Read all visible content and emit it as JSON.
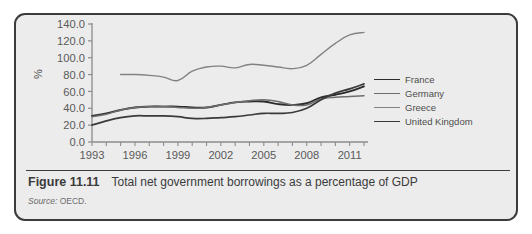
{
  "figure": {
    "number_label": "Figure 11.11",
    "caption": "Total net government borrowings as a percentage of GDP",
    "source_label": "Source:",
    "source_value": "OECD."
  },
  "colors": {
    "card_background": "#ececec",
    "card_border": "#3b3b3b",
    "axis": "#8c8c8c",
    "france": "#2b2b2b",
    "germany": "#6e6e6e",
    "greece": "#828282",
    "united_kingdom": "#3a3a3a",
    "tick_text": "#5a5a5a",
    "caption_text": "#3b3b3b"
  },
  "legend": {
    "position": "right",
    "entries": [
      {
        "label": "France",
        "color": "#2b2b2b"
      },
      {
        "label": "Germany",
        "color": "#6e6e6e"
      },
      {
        "label": "Greece",
        "color": "#828282"
      },
      {
        "label": "United Kingdom",
        "color": "#3a3a3a"
      }
    ]
  },
  "axes": {
    "y_unit_label": "%",
    "y_ticks": [
      "0.0",
      "20.0",
      "40.0",
      "60.0",
      "80.0",
      "100.0",
      "120.0",
      "140.0"
    ],
    "x_ticks": [
      "1993",
      "1996",
      "1999",
      "2002",
      "2005",
      "2008",
      "2011"
    ]
  },
  "chart_data": {
    "type": "line",
    "title": "Total net government borrowings as a percentage of GDP",
    "xlabel": "",
    "ylabel": "%",
    "ylim": [
      0,
      140
    ],
    "xlim": [
      1993,
      2012
    ],
    "grid": false,
    "legend_position": "right",
    "x": [
      1993,
      1994,
      1995,
      1996,
      1997,
      1998,
      1999,
      2000,
      2001,
      2002,
      2003,
      2004,
      2005,
      2006,
      2007,
      2008,
      2009,
      2010,
      2011,
      2012
    ],
    "series": [
      {
        "name": "France",
        "color": "#2b2b2b",
        "values": [
          31,
          34,
          38,
          41,
          42,
          42,
          42,
          41,
          41,
          44,
          47,
          48,
          48,
          45,
          44,
          46,
          53,
          56,
          60,
          66
        ]
      },
      {
        "name": "Germany",
        "color": "#6e6e6e",
        "values": [
          30,
          33,
          38,
          41,
          42,
          42,
          41,
          40,
          41,
          44,
          47,
          49,
          50,
          48,
          44,
          44,
          51,
          53,
          54,
          55
        ]
      },
      {
        "name": "Greece",
        "color": "#828282",
        "values": [
          null,
          null,
          80,
          80,
          79,
          77,
          73,
          84,
          89,
          90,
          88,
          92,
          91,
          89,
          87,
          91,
          104,
          117,
          127,
          130
        ]
      },
      {
        "name": "United Kingdom",
        "color": "#3a3a3a",
        "values": [
          20,
          25,
          29,
          31,
          31,
          31,
          30,
          28,
          28,
          29,
          30,
          32,
          34,
          34,
          35,
          40,
          50,
          58,
          63,
          69
        ]
      }
    ]
  }
}
